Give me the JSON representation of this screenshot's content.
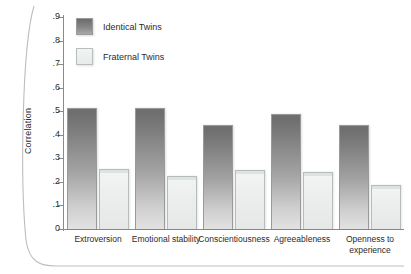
{
  "chart_data": {
    "type": "bar",
    "title": "",
    "xlabel": "",
    "ylabel": "Correlation",
    "ylim": [
      0,
      0.9
    ],
    "yticks": [
      ".9",
      ".8",
      ".7",
      ".6",
      ".5",
      ".4",
      ".3",
      ".2",
      ".1",
      "0"
    ],
    "ytick_values": [
      0.9,
      0.8,
      0.7,
      0.6,
      0.5,
      0.4,
      0.3,
      0.2,
      0.1,
      0
    ],
    "grid": false,
    "legend_position": "top-left",
    "categories": [
      "Extroversion",
      "Emotional stability",
      "Conscientiousness",
      "Agreeableness",
      "Openness to experience"
    ],
    "series": [
      {
        "name": "Identical Twins",
        "color": "#6b6b6b",
        "values": [
          0.515,
          0.515,
          0.44,
          0.49,
          0.44
        ]
      },
      {
        "name": "Fraternal Twins",
        "color": "#eceeee",
        "values": [
          0.255,
          0.225,
          0.25,
          0.24,
          0.185
        ]
      }
    ]
  },
  "legend": {
    "items": [
      {
        "label": "Identical Twins",
        "swatch": "identical"
      },
      {
        "label": "Fraternal Twins",
        "swatch": "fraternal"
      }
    ]
  },
  "axis": {
    "y_title": "Correlation"
  }
}
